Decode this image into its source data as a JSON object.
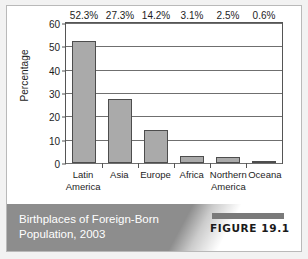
{
  "figure": {
    "caption_line1": "Birthplaces of Foreign-Born",
    "caption_line2": "Population, 2003",
    "tag": "FIGURE 19.1"
  },
  "colors": {
    "bar_fill": "#aaaaaa",
    "bar_border": "#4d4d4d",
    "caption_band": "#8d8d8d",
    "caption_text": "#ffffff",
    "axis": "#555555"
  },
  "chart_data": {
    "type": "bar",
    "title": "Birthplaces of Foreign-Born Population, 2003",
    "xlabel": "",
    "ylabel": "Percentage",
    "ylim": [
      0,
      60
    ],
    "yticks": [
      0,
      10,
      20,
      30,
      40,
      50,
      60
    ],
    "ytick_labels": [
      "0",
      "10",
      "20",
      "30",
      "40",
      "50",
      "60"
    ],
    "grid": true,
    "legend": false,
    "categories": [
      "Latin America",
      "Asia",
      "Europe",
      "Africa",
      "Northern America",
      "Oceana"
    ],
    "category_lines": [
      [
        "Latin",
        "America"
      ],
      [
        "Asia"
      ],
      [
        "Europe"
      ],
      [
        "Africa"
      ],
      [
        "Northern",
        "America"
      ],
      [
        "Oceana"
      ]
    ],
    "values": [
      52.3,
      27.3,
      14.2,
      3.1,
      2.5,
      0.6
    ],
    "data_labels": [
      "52.3%",
      "27.3%",
      "14.2%",
      "3.1%",
      "2.5%",
      "0.6%"
    ]
  }
}
